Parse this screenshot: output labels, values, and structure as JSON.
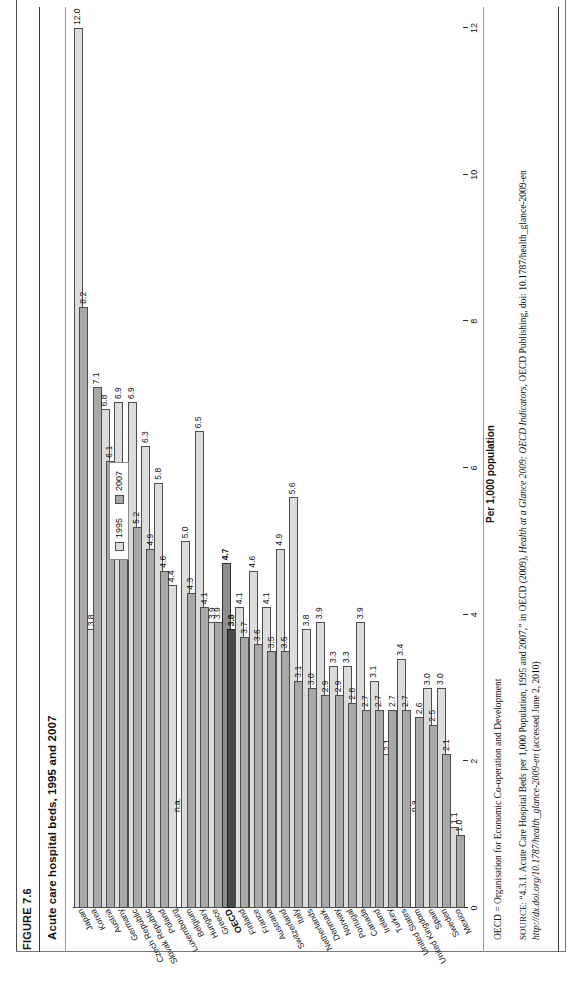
{
  "figure": {
    "number": "FIGURE 7.6",
    "title": "Acute care hospital beds, 1995 and 2007"
  },
  "legend": {
    "items": [
      {
        "label": "1995",
        "color": "#dcdcdc"
      },
      {
        "label": "2007",
        "color": "#a8a8a8"
      }
    ]
  },
  "notes": {
    "oecd": "OECD = Organisation for Economic Co-operation and Development",
    "source_prefix": "SOURCE:",
    "source_part1": " “4.3.1. Acute Care Hospital Beds per 1,000 Population, 1995 and 2007,” in OECD (2009), ",
    "source_italic1": "Health at a Glance 2009: OECD Indicators",
    "source_part2": ", OECD Publishing, doi: 10.1787/health_glance-2009-en ",
    "source_italic2": "http://dx.doi.org/10.1787/health_glance-2009-en",
    "source_part3": " (accessed June 2, 2010)"
  },
  "footer": {
    "left": "",
    "right": ""
  },
  "chart_data": {
    "type": "bar",
    "orientation": "vertical-columns-rotated",
    "title": "Acute care hospital beds, 1995 and 2007",
    "xlabel": "",
    "ylabel": "Per 1,000 population",
    "ylim": [
      0,
      12
    ],
    "yticks": [
      0,
      2,
      4,
      6,
      8,
      10,
      12
    ],
    "ytick_labels": [
      "0",
      "2",
      "4",
      "6",
      "8",
      "10",
      "12"
    ],
    "grid": false,
    "legend_position": "upper-right",
    "na_label": "n.a.",
    "highlight_category": "OECD",
    "categories": [
      "Japan",
      "Korea",
      "Austria",
      "Germany",
      "Czech Republic",
      "Slovak Republic",
      "Poland",
      "Luxembourg",
      "Belgium",
      "Hungary",
      "Greece",
      "OECD",
      "Finland",
      "France",
      "Austrana",
      "Switzerland",
      "Italy",
      "Netherlands",
      "Denmark",
      "Norway",
      "Portugal",
      "Canada",
      "Ireland",
      "Turkey",
      "United States",
      "United Kingdom",
      "Spain",
      "Sweden",
      "Mexico"
    ],
    "series": [
      {
        "name": "1995",
        "color": "#dcdcdc",
        "values": [
          12.0,
          3.8,
          6.8,
          6.9,
          6.9,
          6.3,
          5.8,
          4.4,
          5.0,
          6.5,
          3.9,
          4.7,
          4.1,
          4.6,
          4.1,
          4.9,
          5.6,
          3.8,
          3.9,
          3.3,
          3.3,
          3.9,
          3.1,
          2.1,
          3.4,
          null,
          3.0,
          3.0,
          1.1
        ],
        "labels": [
          "12.0",
          "3.8",
          "6.8",
          "6.9",
          "6.9",
          "6.3",
          "5.8",
          "4.4",
          "5.0",
          "6.5",
          "3.9",
          "4.7",
          "4.1",
          "4.6",
          "4.1",
          "4.9",
          "5.6",
          "3.8",
          "3.9",
          "3.3",
          "3.3",
          "3.9",
          "3.1",
          "2.1",
          "3.4",
          "n.a.",
          "3.0",
          "3.0",
          "1.1"
        ]
      },
      {
        "name": "2007",
        "color": "#a8a8a8",
        "values": [
          8.2,
          7.1,
          6.1,
          5.7,
          5.2,
          4.9,
          4.6,
          null,
          4.3,
          4.1,
          3.9,
          3.8,
          3.7,
          3.6,
          3.5,
          3.5,
          3.1,
          3.0,
          2.9,
          2.9,
          2.8,
          2.7,
          2.7,
          2.7,
          2.7,
          2.6,
          2.5,
          2.1,
          1.0
        ],
        "labels": [
          "8.2",
          "7.1",
          "6.1",
          "5.7",
          "5.2",
          "4.9",
          "4.6",
          "n.a.",
          "4.3",
          "4.1",
          "3.9",
          "3.8",
          "3.7",
          "3.6",
          "3.5",
          "3.5",
          "3.1",
          "3.0",
          "2.9",
          "2.9",
          "2.8",
          "2.7",
          "2.7",
          "2.7",
          "2.7",
          "2.6",
          "2.5",
          "2.1",
          "1.0"
        ]
      }
    ]
  }
}
